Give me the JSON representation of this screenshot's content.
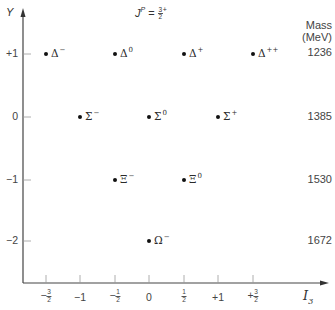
{
  "title": {
    "symbol": "J",
    "superscript": "P",
    "equals": "=",
    "frac_num": "3",
    "frac_den": "2",
    "parity": "+"
  },
  "axes": {
    "x_label": "I",
    "x_label_sub": "3",
    "y_label": "Y",
    "x_ticks": [
      {
        "sign": "−",
        "num": "3",
        "den": "2",
        "value": -1.5
      },
      {
        "text": "−1",
        "value": -1
      },
      {
        "sign": "−",
        "num": "1",
        "den": "2",
        "value": -0.5
      },
      {
        "text": "0",
        "value": 0
      },
      {
        "sign": "",
        "num": "1",
        "den": "2",
        "value": 0.5
      },
      {
        "text": "+1",
        "value": 1
      },
      {
        "sign": "+",
        "num": "3",
        "den": "2",
        "value": 1.5
      }
    ],
    "y_ticks": [
      {
        "text": "+1",
        "value": 1
      },
      {
        "text": "0",
        "value": 0
      },
      {
        "text": "−1",
        "value": -1
      },
      {
        "text": "−2",
        "value": -2
      }
    ]
  },
  "mass_header": {
    "line1": "Mass",
    "line2": "(MeV)"
  },
  "masses": [
    "1236",
    "1385",
    "1530",
    "1672"
  ],
  "particles": [
    {
      "name": "Δ",
      "charge": "−",
      "I3": -1.5,
      "Y": 1
    },
    {
      "name": "Δ",
      "charge": "0",
      "I3": -0.5,
      "Y": 1
    },
    {
      "name": "Δ",
      "charge": "+",
      "I3": 0.5,
      "Y": 1
    },
    {
      "name": "Δ",
      "charge": "++",
      "I3": 1.5,
      "Y": 1
    },
    {
      "name": "Σ",
      "charge": "−",
      "I3": -1,
      "Y": 0
    },
    {
      "name": "Σ",
      "charge": "0",
      "I3": 0,
      "Y": 0
    },
    {
      "name": "Σ",
      "charge": "+",
      "I3": 1,
      "Y": 0
    },
    {
      "name": "Ξ",
      "charge": "−",
      "I3": -0.5,
      "Y": -1
    },
    {
      "name": "Ξ",
      "charge": "0",
      "I3": 0.5,
      "Y": -1
    },
    {
      "name": "Ω",
      "charge": "−",
      "I3": 0,
      "Y": -2
    }
  ]
}
